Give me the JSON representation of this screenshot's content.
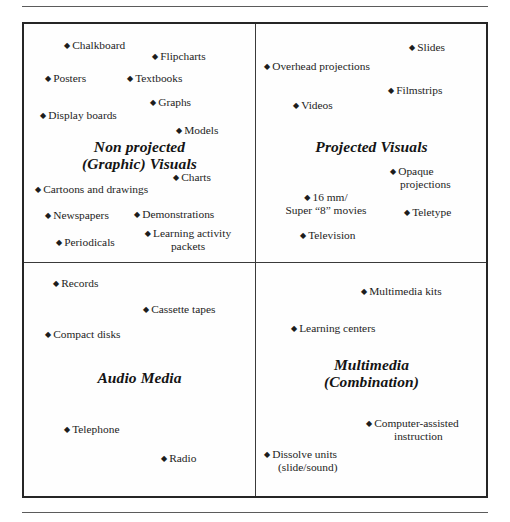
{
  "figure": {
    "bullet_glyph": "♦",
    "rules": {
      "top": true,
      "bottom": true
    },
    "quadrants": [
      {
        "id": "non-projected-graphic-visuals",
        "heading_line1": "Non projected",
        "heading_line2": "(Graphic) Visuals",
        "items": [
          {
            "label": "Chalkboard"
          },
          {
            "label": "Flipcharts"
          },
          {
            "label": "Posters"
          },
          {
            "label": "Textbooks"
          },
          {
            "label": "Graphs"
          },
          {
            "label": "Display boards"
          },
          {
            "label": "Models"
          },
          {
            "label": "Charts"
          },
          {
            "label": "Cartoons and drawings"
          },
          {
            "label": "Newspapers"
          },
          {
            "label": "Demonstrations"
          },
          {
            "label": "Periodicals"
          },
          {
            "label": "Learning activity",
            "label_line2": "packets"
          }
        ]
      },
      {
        "id": "projected-visuals",
        "heading_line1": "Projected Visuals",
        "heading_line2": "",
        "items": [
          {
            "label": "Slides"
          },
          {
            "label": "Overhead projections"
          },
          {
            "label": "Filmstrips"
          },
          {
            "label": "Videos"
          },
          {
            "label": "Opaque",
            "label_line2": "projections"
          },
          {
            "label": "16 mm/",
            "label_line2": "Super “8” movies"
          },
          {
            "label": "Teletype"
          },
          {
            "label": "Television"
          }
        ]
      },
      {
        "id": "audio-media",
        "heading_line1": "Audio Media",
        "heading_line2": "",
        "items": [
          {
            "label": "Records"
          },
          {
            "label": "Cassette tapes"
          },
          {
            "label": "Compact disks"
          },
          {
            "label": "Telephone"
          },
          {
            "label": "Radio"
          }
        ]
      },
      {
        "id": "multimedia-combination",
        "heading_line1": "Multimedia",
        "heading_line2": "(Combination)",
        "items": [
          {
            "label": "Multimedia kits"
          },
          {
            "label": "Learning centers"
          },
          {
            "label": "Computer-assisted",
            "label_line2": "instruction"
          },
          {
            "label": "Dissolve units",
            "label_line2": "(slide/sound)"
          }
        ]
      }
    ]
  }
}
